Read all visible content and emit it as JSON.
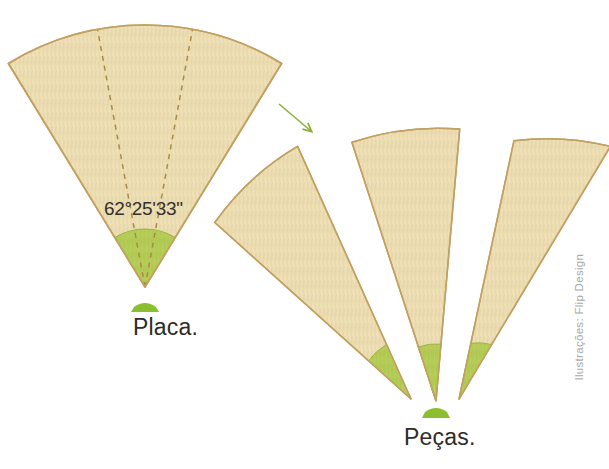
{
  "figure": {
    "background_color": "#ffffff",
    "width": 609,
    "height": 469
  },
  "palette": {
    "wood_fill": "#ecdcae",
    "wood_fill_light": "#f3e8c8",
    "wood_stroke": "#c2a062",
    "wood_grain": "#dcc894",
    "green_fill": "#b4cc56",
    "green_stroke": "#9cb544",
    "green_icon": "#8cbf30",
    "dashed_line": "#a98b45",
    "arrow_color": "#8fae3e",
    "text_color": "#2e2b28",
    "credit_color": "#a9a9a9"
  },
  "labels": {
    "angle": "62°25'33\"",
    "placa": "Placa.",
    "pecas": "Peças.",
    "credit": "Ilustrações: Flip Design"
  },
  "icons": {
    "arrow": "arrow-down-right-icon",
    "placa_marker": "green-trapezoid-icon",
    "pecas_marker": "green-trapezoid-icon"
  },
  "shapes": {
    "plate": {
      "name": "large-wood-sector",
      "apex": [
        145,
        287
      ],
      "radius": 262,
      "start_angle_deg": 238.5,
      "end_angle_deg": 301.5,
      "total_angle_deg": 63,
      "green_band_radius": 58,
      "division_count": 3,
      "division_angle_deg": "62°25'33\""
    },
    "pieces": [
      {
        "name": "piece-left",
        "apex": [
          411,
          399
        ],
        "radius": 264,
        "start_angle_deg": 222,
        "end_angle_deg": 245,
        "green_band_radius": 57
      },
      {
        "name": "piece-center",
        "apex": [
          436,
          401
        ],
        "radius": 272,
        "start_angle_deg": 252,
        "end_angle_deg": 275,
        "green_band_radius": 57
      },
      {
        "name": "piece-right",
        "apex": [
          459,
          399
        ],
        "radius": 264,
        "start_angle_deg": 282,
        "end_angle_deg": 305,
        "green_band_radius": 57
      }
    ]
  },
  "arrow": {
    "x1": 279,
    "y1": 104,
    "x2": 313,
    "y2": 133
  }
}
